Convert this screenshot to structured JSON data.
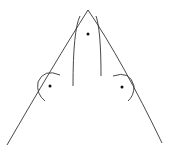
{
  "diagram": {
    "background": "#ffffff",
    "stroke_color": "#333333",
    "dot_color": "#111111",
    "apex": [
      88,
      10
    ],
    "left_leg_end": [
      7,
      145
    ],
    "right_leg_end": [
      162,
      143
    ],
    "inner_left_curve": "M 80 16 Q 73 30 73 86",
    "inner_right_curve": "M 96 16 Q 101 30 101 76",
    "left_arc": "M 60 75 Q 44 68 38 82 Q 36 94 45 101",
    "right_arc": "M 113 76 Q 130 70 134 86 Q 134 96 128 101",
    "dots": [
      {
        "name": "apex-interior-point",
        "cx": 88,
        "cy": 34
      },
      {
        "name": "left-point",
        "cx": 50,
        "cy": 86
      },
      {
        "name": "right-point",
        "cx": 122,
        "cy": 87
      }
    ]
  }
}
